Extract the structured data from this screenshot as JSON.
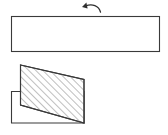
{
  "figure": {
    "background_color": "#ffffff",
    "line_color": "#3a3a3a",
    "hatch_color": "#555555",
    "arrow_color": "#2e2e2e",
    "width": 168,
    "height": 135
  },
  "rotation_arrow": {
    "name": "counterclockwise rotation arrow",
    "direction": "counterclockwise",
    "path": "M 100.5 12.2 C 99.0 5.6 92.0 3.4 85.5 6.0",
    "head_points": "86.4,2.6 82.0,6.9 87.6,8.6",
    "x_start": 83,
    "x_end": 101,
    "y_top": 4,
    "y_bottom": 13
  },
  "top_view": {
    "name": "top rectangular plate outline",
    "x": 11.5,
    "y": 16.5,
    "width": 148,
    "height": 35
  },
  "front_view": {
    "base_outline": {
      "name": "unhatched base block outline",
      "points": "11.5,91.5 84.0,91.5 84.0,123.0 11.5,123.0"
    },
    "hatched_section": {
      "name": "sectioned angled block",
      "points": "20.5,65.0 84.0,79.5 84.0,123.0 20.5,105.0",
      "fill": "#ffffff",
      "hatch_angle_degrees": 45,
      "hatch_spacing": 5
    }
  }
}
